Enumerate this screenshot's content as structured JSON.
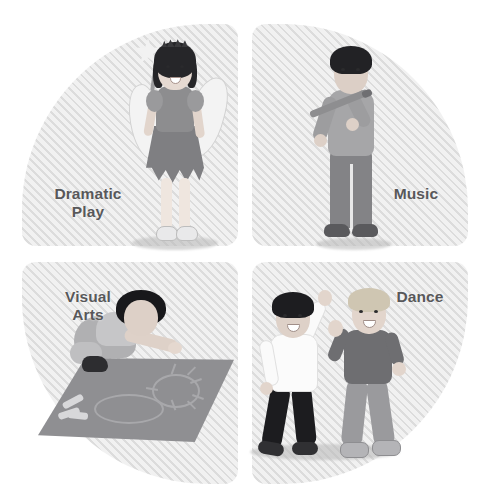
{
  "diagram": {
    "layout": "four-quadrant circle",
    "background_color": "#ffffff",
    "quadrant_fill": "#e8e8e8",
    "quadrant_stripe_color": "#dcdcdc",
    "label_color": "#58585a",
    "quadrants": [
      {
        "id": "dramatic-play",
        "label": "Dramatic\nPlay",
        "position": "top-left",
        "illustration": "girl-in-fairy-costume-with-wand"
      },
      {
        "id": "music",
        "label": "Music",
        "position": "top-right",
        "illustration": "boy-playing-flute"
      },
      {
        "id": "visual-arts",
        "label": "Visual\nArts",
        "position": "bottom-left",
        "illustration": "child-drawing-sun-and-cloud-with-chalk-on-mat"
      },
      {
        "id": "dance",
        "label": "Dance",
        "position": "bottom-right",
        "illustration": "two-children-dancing"
      }
    ]
  }
}
